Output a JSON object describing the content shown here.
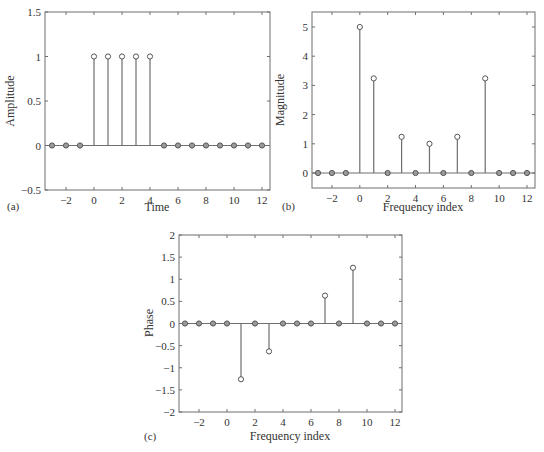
{
  "chart_data": [
    {
      "id": "a",
      "type": "stem",
      "panel_label": "(a)",
      "title": "",
      "xlabel": "Time",
      "ylabel": "Amplitude",
      "xlim": [
        -3.3,
        12.5
      ],
      "ylim": [
        -0.5,
        1.5
      ],
      "xticks": [
        -2,
        0,
        2,
        4,
        6,
        8,
        10,
        12
      ],
      "yticks": [
        -0.5,
        0,
        0.5,
        1,
        1.5
      ],
      "ytick_labels": [
        "−0.5",
        "0",
        "0.5",
        "1",
        "1.5"
      ],
      "xtick_labels": [
        "−2",
        "0",
        "2",
        "4",
        "6",
        "8",
        "10",
        "12"
      ],
      "x": [
        -3,
        -2,
        -1,
        0,
        1,
        2,
        3,
        4,
        5,
        6,
        7,
        8,
        9,
        10,
        11,
        12
      ],
      "values": [
        0,
        0,
        0,
        1,
        1,
        1,
        1,
        1,
        0,
        0,
        0,
        0,
        0,
        0,
        0,
        0
      ],
      "grid": false
    },
    {
      "id": "b",
      "type": "stem",
      "panel_label": "(b)",
      "title": "",
      "xlabel": "Frequency index",
      "ylabel": "Magnitude",
      "xlim": [
        -3.5,
        12.5
      ],
      "ylim": [
        -0.5,
        5.5
      ],
      "xticks": [
        -2,
        0,
        2,
        4,
        6,
        8,
        10,
        12
      ],
      "yticks": [
        0,
        1,
        2,
        3,
        4,
        5
      ],
      "ytick_labels": [
        "0",
        "1",
        "2",
        "3",
        "4",
        "5"
      ],
      "xtick_labels": [
        "−2",
        "0",
        "2",
        "4",
        "6",
        "8",
        "10",
        "12"
      ],
      "x": [
        -3,
        -2,
        -1,
        0,
        1,
        2,
        3,
        4,
        5,
        6,
        7,
        8,
        9,
        10,
        11,
        12
      ],
      "values": [
        0,
        0,
        0,
        5,
        3.24,
        0,
        1.24,
        0,
        1,
        0,
        1.24,
        0,
        3.24,
        0,
        0,
        0
      ],
      "grid": false
    },
    {
      "id": "c",
      "type": "stem",
      "panel_label": "(c)",
      "title": "",
      "xlabel": "Frequency index",
      "ylabel": "Phase",
      "xlim": [
        -3.5,
        12.5
      ],
      "ylim": [
        -2,
        2
      ],
      "xticks": [
        -2,
        0,
        2,
        4,
        6,
        8,
        10,
        12
      ],
      "yticks": [
        -2,
        -1.5,
        -1,
        -0.5,
        0,
        0.5,
        1,
        1.5,
        2
      ],
      "ytick_labels": [
        "−2",
        "−1.5",
        "−1",
        "−0.5",
        "0",
        "0.5",
        "1",
        "1.5",
        "2"
      ],
      "xtick_labels": [
        "−2",
        "0",
        "2",
        "4",
        "6",
        "8",
        "10",
        "12"
      ],
      "x": [
        -3,
        -2,
        -1,
        0,
        1,
        2,
        3,
        4,
        5,
        6,
        7,
        8,
        9,
        10,
        11,
        12
      ],
      "values": [
        0,
        0,
        0,
        0,
        -1.26,
        0,
        -0.63,
        0,
        0,
        0,
        0.63,
        0,
        1.26,
        0,
        0,
        0
      ],
      "grid": false
    }
  ],
  "layout": [
    {
      "box": [
        45,
        12,
        270,
        190
      ],
      "xmap": [
        -3,
        52,
        12,
        262
      ],
      "ymap": [
        1.5,
        12,
        -0.5,
        190
      ],
      "panel_pos": [
        7,
        210
      ],
      "xlabel_pos": [
        157,
        211
      ],
      "ylabel_pos": [
        14,
        101
      ]
    },
    {
      "box": [
        312,
        12,
        535,
        188
      ],
      "xmap": [
        -3,
        318,
        12,
        527
      ],
      "ymap": [
        5,
        27,
        0,
        173
      ],
      "panel_pos": [
        282,
        210
      ],
      "xlabel_pos": [
        423,
        211
      ],
      "ylabel_pos": [
        284,
        100
      ]
    },
    {
      "box": [
        179,
        235,
        402,
        412
      ],
      "xmap": [
        -3,
        185,
        12,
        395
      ],
      "ymap": [
        2,
        235,
        -2,
        412
      ],
      "panel_pos": [
        144,
        440
      ],
      "xlabel_pos": [
        290,
        440
      ],
      "ylabel_pos": [
        153,
        323
      ]
    }
  ],
  "colors": {
    "axis": "#6e6e6e",
    "stem": "#6e6e6e",
    "marker_stroke": "#555555",
    "marker_fill_zero": "#9a9a9a",
    "text": "#333333"
  }
}
